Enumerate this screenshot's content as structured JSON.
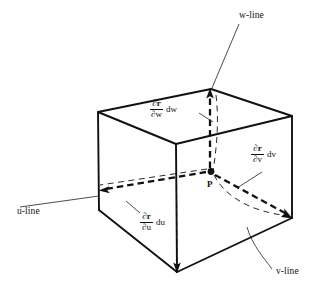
{
  "figure": {
    "type": "3d-coordinate-volume-element-diagram",
    "point": {
      "label": "P",
      "x": 211,
      "y": 172
    },
    "axis_lines": [
      {
        "name": "u-line",
        "label": "u-line",
        "x": 18,
        "y": 212
      },
      {
        "name": "v-line",
        "label": "v-line",
        "x": 277,
        "y": 272
      },
      {
        "name": "w-line",
        "label": "w-line",
        "x": 243,
        "y": 16
      }
    ],
    "vectors": [
      {
        "name": "partial-r-partial-w",
        "numerator": "∂r",
        "denominator": "∂w",
        "differential": "dw",
        "x": 152,
        "y": 101
      },
      {
        "name": "partial-r-partial-v",
        "numerator": "∂r",
        "denominator": "∂v",
        "differential": "dv",
        "x": 252,
        "y": 146
      },
      {
        "name": "partial-r-partial-u",
        "numerator": "∂r",
        "denominator": "∂u",
        "differential": "du",
        "x": 141,
        "y": 214
      }
    ],
    "colors": {
      "stroke": "#111111",
      "background": "#ffffff"
    }
  }
}
